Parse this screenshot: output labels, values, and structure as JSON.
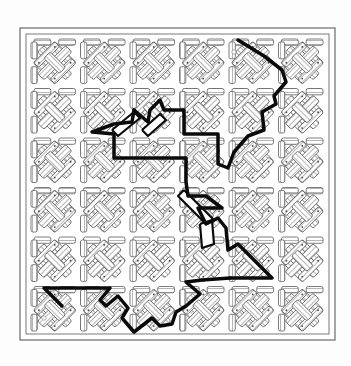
{
  "diagram": {
    "kind": "maze",
    "canvas": {
      "width": 351,
      "height": 366,
      "background": "#fdfdfd"
    },
    "frame": {
      "outer": {
        "x": 20,
        "y": 28,
        "w": 315,
        "h": 312
      },
      "inner": {
        "x": 26,
        "y": 34,
        "w": 303,
        "h": 300
      },
      "stroke": "#6a6a6a"
    },
    "grid": {
      "cols": 6,
      "rows": 6,
      "origin_x": 30,
      "origin_y": 38,
      "tile": 49.5
    },
    "colors": {
      "hatch": "#5a5a5a",
      "band_fill": "#ffffff",
      "path": "#0a0a0a",
      "marker": "#ffffff"
    },
    "start_marker": {
      "label": "start",
      "x": 44,
      "y": 318
    },
    "end_marker": {
      "label": "end",
      "x": 234,
      "y": 52
    },
    "solution_path": {
      "stroke_width": 3.5,
      "segments": [
        [
          [
            62,
            306
          ],
          [
            44,
            288
          ],
          [
            110,
            288
          ],
          [
            100,
            300
          ],
          [
            106,
            306
          ],
          [
            118,
            296
          ],
          [
            128,
            308
          ],
          [
            122,
            318
          ],
          [
            134,
            332
          ],
          [
            152,
            318
          ],
          [
            160,
            326
          ],
          [
            172,
            324
          ],
          [
            176,
            312
          ],
          [
            186,
            306
          ],
          [
            200,
            294
          ],
          [
            186,
            282
          ],
          [
            202,
            280
          ],
          [
            230,
            278
          ]
        ],
        [
          [
            230,
            278
          ],
          [
            272,
            278
          ],
          [
            238,
            244
          ],
          [
            228,
            250
          ],
          [
            226,
            228
          ],
          [
            218,
            218
          ],
          [
            206,
            224
          ],
          [
            198,
            208
          ],
          [
            222,
            208
          ],
          [
            206,
            196
          ],
          [
            188,
            196
          ],
          [
            186,
            182
          ],
          [
            186,
            158
          ],
          [
            114,
            158
          ],
          [
            114,
            134
          ],
          [
            92,
            132
          ],
          [
            114,
            124
          ],
          [
            132,
            122
          ],
          [
            134,
            110
          ]
        ],
        [
          [
            134,
            110
          ],
          [
            148,
            122
          ],
          [
            150,
            110
          ],
          [
            160,
            100
          ],
          [
            164,
            110
          ],
          [
            184,
            110
          ],
          [
            184,
            134
          ],
          [
            218,
            134
          ],
          [
            218,
            164
          ],
          [
            228,
            168
          ],
          [
            234,
            152
          ],
          [
            248,
            136
          ],
          [
            264,
            130
          ],
          [
            262,
            112
          ],
          [
            276,
            104
          ],
          [
            274,
            96
          ],
          [
            286,
            82
          ],
          [
            282,
            70
          ],
          [
            264,
            56
          ],
          [
            238,
            40
          ]
        ]
      ],
      "branches": [
        {
          "hollow": true,
          "points": [
            [
              142,
              130
            ],
            [
              160,
              114
            ],
            [
              166,
              120
            ],
            [
              148,
              136
            ],
            [
              142,
              130
            ]
          ]
        },
        {
          "hollow": true,
          "points": [
            [
              112,
              130
            ],
            [
              134,
              112
            ],
            [
              140,
              118
            ],
            [
              118,
              136
            ],
            [
              112,
              130
            ]
          ]
        },
        {
          "hollow": true,
          "points": [
            [
              184,
              190
            ],
            [
              214,
              220
            ],
            [
              208,
              226
            ],
            [
              178,
              196
            ],
            [
              184,
              190
            ]
          ]
        },
        {
          "hollow": true,
          "points": [
            [
              200,
              224
            ],
            [
              212,
              220
            ],
            [
              214,
              244
            ],
            [
              202,
              248
            ],
            [
              200,
              224
            ]
          ]
        }
      ]
    }
  }
}
